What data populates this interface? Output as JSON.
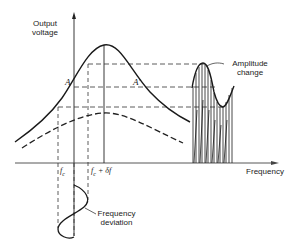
{
  "diagram": {
    "type": "FM slope detection diagram",
    "y_axis_label_line1": "Output",
    "y_axis_label_line2": "voltage",
    "x_axis_label": "Frequency",
    "point_a": "A",
    "point_a_prime": "A'",
    "fc_label": "f",
    "fc_sub": "c",
    "fc_plus_label": "f",
    "fc_plus_sub": "c",
    "fc_plus_suffix": " + δf",
    "amplitude_label_line1": "Amplitude",
    "amplitude_label_line2": "change",
    "deviation_label_line1": "Frequency",
    "deviation_label_line2": "deviation",
    "colors": {
      "line": "#1a1a1a",
      "background": "#ffffff"
    }
  }
}
